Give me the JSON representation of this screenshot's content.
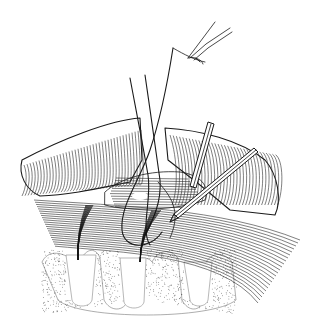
{
  "image": {
    "kind": "surgical line illustration",
    "style": "pen-and-ink, black on white",
    "colors": {
      "ink": "#1a1a1a",
      "background": "#ffffff",
      "stipple": "#555555"
    }
  },
  "elements": [
    {
      "name": "forceps",
      "description": "fine forceps upper right holding suture"
    },
    {
      "name": "suture-threads",
      "description": "two suture strands passing down through tissue"
    },
    {
      "name": "retractor",
      "description": "angled instrument lower right"
    },
    {
      "name": "probe",
      "description": "vertical instrument right of center"
    },
    {
      "name": "tissue-flaps",
      "description": "hatched retracted soft tissue folds"
    },
    {
      "name": "muscle-fibers",
      "description": "long horizontal fibrous bands"
    },
    {
      "name": "bone-teeth",
      "description": "stippled root/bone structures at bottom"
    }
  ]
}
